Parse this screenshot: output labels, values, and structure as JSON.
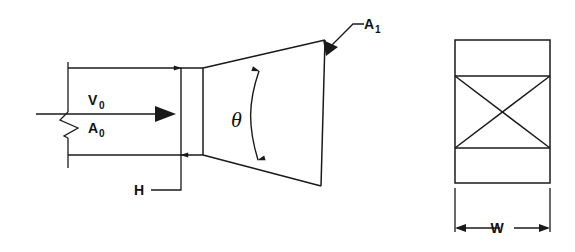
{
  "figure": {
    "background_color": "#ffffff",
    "line_color": "#1a1a1a",
    "views": [
      {
        "name": "side-elevation-view",
        "position": "left"
      },
      {
        "name": "end-section-view",
        "position": "right"
      }
    ]
  },
  "labels": {
    "velocity": {
      "symbol": "V",
      "subscript": "0",
      "full": "V0",
      "name": "inlet-velocity-label"
    },
    "inlet_area": {
      "symbol": "A",
      "subscript": "0",
      "full": "A0",
      "name": "inlet-area-label"
    },
    "outlet_area": {
      "symbol": "A",
      "subscript": "1",
      "full": "A1",
      "name": "outlet-area-label"
    },
    "angle": {
      "symbol": "θ",
      "full": "θ",
      "name": "divergence-angle-label"
    },
    "height": {
      "symbol": "H",
      "full": "H",
      "name": "channel-height-label"
    },
    "width": {
      "symbol": "W",
      "full": "W",
      "name": "channel-width-label"
    }
  },
  "annotations": {
    "break_symbol": "flow-break-zigzag",
    "flow_arrow": "flow-direction-arrow",
    "height_dimension": "H",
    "width_dimension": "W",
    "angle_dimension": "θ"
  }
}
